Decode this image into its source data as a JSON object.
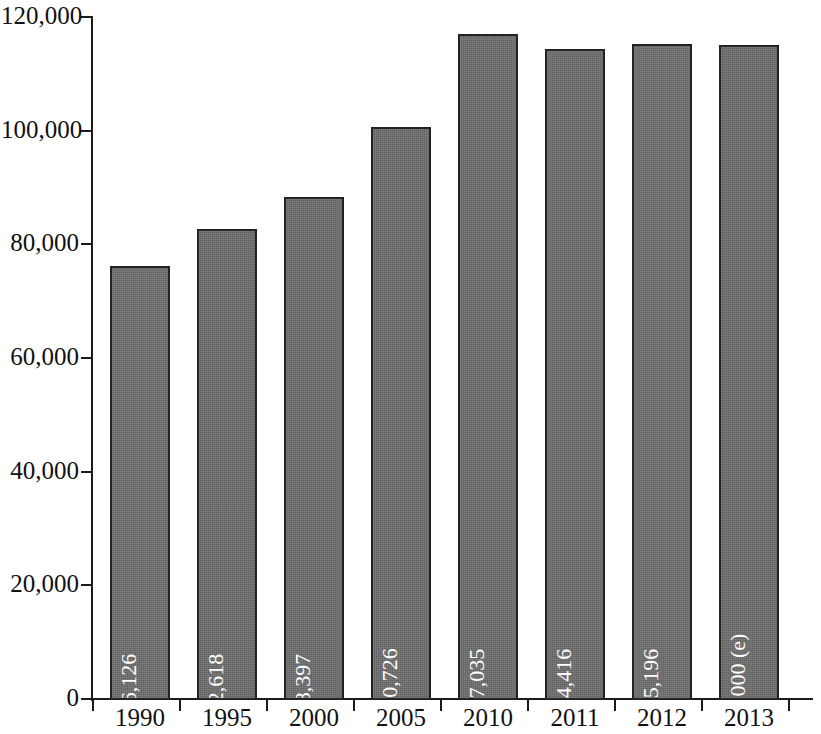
{
  "chart_data": {
    "type": "bar",
    "title": "",
    "subtitle": "",
    "xlabel": "",
    "ylabel": "",
    "categories": [
      "1990",
      "1995",
      "2000",
      "2005",
      "2010",
      "2011",
      "2012",
      "2013"
    ],
    "values": [
      76126,
      82618,
      88397,
      100726,
      117035,
      114416,
      115196,
      115000
    ],
    "value_labels": [
      "76,126",
      "82,618",
      "88,397",
      "100,726",
      "117,035",
      "114,416",
      "115,196",
      "115,000 (e)"
    ],
    "ylim": [
      0,
      120000
    ],
    "y_ticks": [
      0,
      20000,
      40000,
      60000,
      80000,
      100000,
      120000
    ],
    "y_tick_labels": [
      "0",
      "20,000",
      "40,000",
      "60,000",
      "80,000",
      "100,000",
      "120,000"
    ],
    "grid": false,
    "legend": null,
    "series": [
      {
        "name": "",
        "values": [
          76126,
          82618,
          88397,
          100726,
          117035,
          114416,
          115196,
          115000
        ]
      }
    ],
    "annotations": [
      "(e) denotes estimated value for 2013"
    ],
    "colors": {
      "bar_fill": "#6e6e6e",
      "bar_border": "#232323",
      "axis": "#1b1b1b",
      "value_label": "#ffffff",
      "background": "#ffffff",
      "tick_label": "#111111"
    }
  }
}
